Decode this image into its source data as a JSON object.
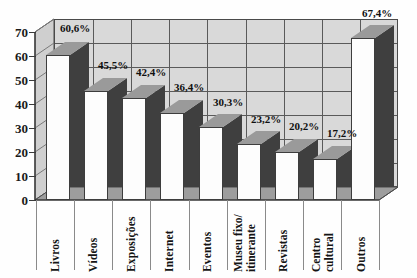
{
  "chart_data": {
    "type": "bar",
    "title": "",
    "subtitle": "",
    "xlabel": "",
    "ylabel": "",
    "categories": [
      "Livros",
      "Vídeos",
      "Exposições",
      "Internet",
      "Eventos",
      "Museu fixo/\nitinerante",
      "Revistas",
      "Centro\ncultural",
      "Outros"
    ],
    "values": [
      60.6,
      45.5,
      42.4,
      36.4,
      30.3,
      23.2,
      20.2,
      17.2,
      67.4
    ],
    "data_labels": [
      "60,6%",
      "45,5%",
      "42,4%",
      "36,4%",
      "30,3%",
      "23,2%",
      "20,2%",
      "17,2%",
      "67,4%"
    ],
    "ylim": [
      0,
      70
    ],
    "ytick_labels": [
      "0",
      "10",
      "20",
      "30",
      "40",
      "50",
      "60",
      "70"
    ],
    "ytick_values": [
      0,
      10,
      20,
      30,
      40,
      50,
      60,
      70
    ],
    "grid": true,
    "legend": null,
    "style": "3d-column",
    "colors": {
      "bar_front": "#fdfdfd",
      "bar_side": "#3f3f3f",
      "bar_top": "#9a9a9a",
      "plot_background": "#d9d9d9",
      "grid_line": "#5a5a5a",
      "axis": "#3a3a3a",
      "text": "#141414",
      "wall": "#cfcfcf",
      "floor": "#9d9d9d"
    }
  }
}
